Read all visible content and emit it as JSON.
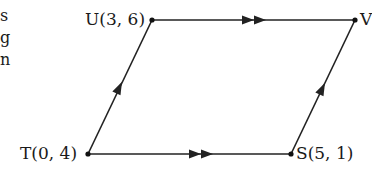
{
  "diagram": {
    "type": "parallelogram",
    "stroke_color": "#222222",
    "vertices": [
      {
        "id": "U",
        "label": "U(3, 6)",
        "px": [
          152,
          20
        ]
      },
      {
        "id": "V",
        "label": "V",
        "px": [
          355,
          20
        ]
      },
      {
        "id": "S",
        "label": "S(5, 1)",
        "px": [
          291,
          154
        ]
      },
      {
        "id": "T",
        "label": "T(0, 4)",
        "px": [
          88,
          154
        ]
      }
    ],
    "edges": [
      {
        "from": "U",
        "to": "V",
        "arrow": "double",
        "direction": "right"
      },
      {
        "from": "T",
        "to": "S",
        "arrow": "double",
        "direction": "right"
      },
      {
        "from": "T",
        "to": "U",
        "arrow": "single",
        "direction": "up"
      },
      {
        "from": "S",
        "to": "V",
        "arrow": "single",
        "direction": "up"
      }
    ]
  },
  "labels": {
    "U": "U(3, 6)",
    "V": "V",
    "T": "T(0, 4)",
    "S": "S(5, 1)"
  },
  "left_text_fragments": [
    "s",
    "g",
    "n"
  ]
}
